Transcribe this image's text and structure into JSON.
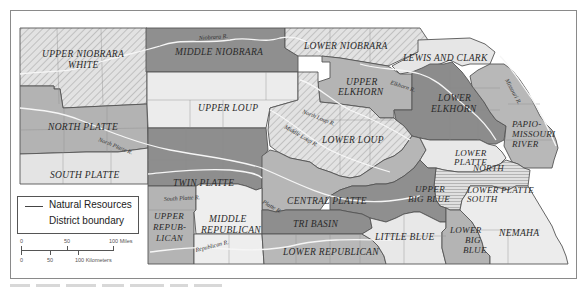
{
  "map": {
    "title": "Nebraska Natural Resources Districts",
    "districts": [
      {
        "name": "UPPER NIOBRARA WHITE",
        "line1": "UPPER NIOBRARA",
        "line2": "WHITE",
        "fill": "hatch"
      },
      {
        "name": "MIDDLE NIOBRARA",
        "line1": "MIDDLE NIOBRARA",
        "fill": "#8f8f8f"
      },
      {
        "name": "LOWER NIOBRARA",
        "line1": "LOWER NIOBRARA",
        "fill": "hatch"
      },
      {
        "name": "LEWIS AND CLARK",
        "line1": "LEWIS AND CLARK",
        "fill": "#e6e6e6"
      },
      {
        "name": "UPPER ELKHORN",
        "line1": "UPPER",
        "line2": "ELKHORN",
        "fill": "#b4b4b4"
      },
      {
        "name": "LOWER ELKHORN",
        "line1": "LOWER",
        "line2": "ELKHORN",
        "fill": "#8c8c8c"
      },
      {
        "name": "PAPIO-MISSOURI RIVER",
        "line1": "PAPIO-",
        "line2": "MISSOURI",
        "line3": "RIVER",
        "fill": "#b8b8b8"
      },
      {
        "name": "NORTH PLATTE",
        "line1": "NORTH PLATTE",
        "fill": "#b3b3b3"
      },
      {
        "name": "SOUTH PLATTE",
        "line1": "SOUTH PLATTE",
        "fill": "#e4e4e4"
      },
      {
        "name": "UPPER LOUP",
        "line1": "UPPER LOUP",
        "fill": "#ececec"
      },
      {
        "name": "LOWER LOUP",
        "line1": "LOWER LOUP",
        "fill": "hatch"
      },
      {
        "name": "TWIN PLATTE",
        "line1": "TWIN PLATTE",
        "fill": "#8e8e8e"
      },
      {
        "name": "CENTRAL PLATTE",
        "line1": "CENTRAL PLATTE",
        "fill": "#b6b6b6"
      },
      {
        "name": "LOWER PLATTE NORTH",
        "line1": "LOWER",
        "line2": "PLATTE",
        "line3": "NORTH",
        "fill": "#e8e8e8"
      },
      {
        "name": "LOWER PLATTE SOUTH",
        "line1": "LOWER PLATTE",
        "line2": "SOUTH",
        "fill": "hlines"
      },
      {
        "name": "UPPER BIG BLUE",
        "line1": "UPPER",
        "line2": "BIG BLUE",
        "fill": "#8f8f8f"
      },
      {
        "name": "UPPER REPUBLICAN",
        "line1": "UPPER",
        "line2": "REPUB-",
        "line3": "LICAN",
        "fill": "#b4b4b4"
      },
      {
        "name": "MIDDLE REPUBLICAN",
        "line1": "MIDDLE",
        "line2": "REPUBLICAN",
        "fill": "#eeeeee"
      },
      {
        "name": "TRI BASIN",
        "line1": "TRI BASIN",
        "fill": "#8e8e8e"
      },
      {
        "name": "LITTLE BLUE",
        "line1": "LITTLE BLUE",
        "fill": "#e8e8e8"
      },
      {
        "name": "LOWER BIG BLUE",
        "line1": "LOWER",
        "line2": "BIG",
        "line3": "BLUE",
        "fill": "#b4b4b4"
      },
      {
        "name": "NEMAHA",
        "line1": "NEMAHA",
        "fill": "#ececec"
      },
      {
        "name": "LOWER REPUBLICAN",
        "line1": "LOWER REPUBLICAN",
        "fill": "#b8b8b8"
      }
    ],
    "rivers": {
      "niobrara": "Niobrara R.",
      "north_loup": "North Loup R.",
      "middle_loup": "Middle Loup R.",
      "elkhorn": "Elkhorn R.",
      "missouri": "Missouri R.",
      "north_platte": "North Platte R.",
      "south_platte": "South Platte R.",
      "platte": "Platte R.",
      "republican": "Republican R."
    }
  },
  "legend": {
    "line1": "Natural Resources",
    "line2": "District boundary"
  },
  "scale": {
    "miles": [
      "0",
      "50",
      "100 Miles"
    ],
    "kilometers": [
      "0",
      "50",
      "100 Kilometers"
    ]
  },
  "colors": {
    "dark": "#8e8e8e",
    "medium": "#b5b5b5",
    "light": "#e8e8e8",
    "border": "#555555",
    "river": "#f4f4f4"
  }
}
